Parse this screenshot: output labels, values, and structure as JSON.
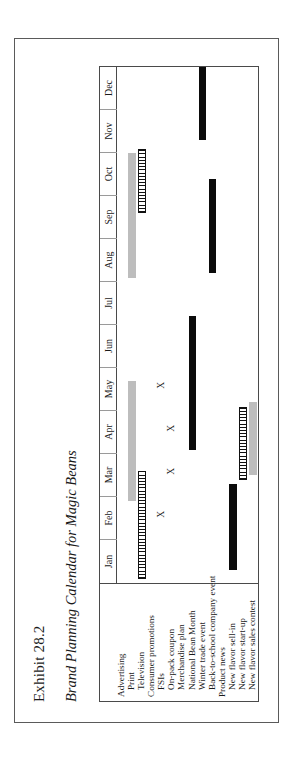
{
  "exhibit": {
    "number": "Exhibit 28.2",
    "title": "Brand Planning Calendar for Magic Beans"
  },
  "chart_data": {
    "type": "bar",
    "title": "Brand Planning Calendar for Magic Beans",
    "xlabel": "",
    "ylabel": "",
    "grid": false,
    "legend": null,
    "categories": [
      "Jan",
      "Feb",
      "Mar",
      "Apr",
      "May",
      "Jun",
      "Jul",
      "Aug",
      "Sep",
      "Oct",
      "Nov",
      "Dec"
    ],
    "xlim": [
      0,
      12
    ],
    "rows": [
      {
        "label": "Advertising",
        "group": true,
        "indent": false,
        "bars": [],
        "marks": []
      },
      {
        "label": "Print",
        "group": false,
        "indent": true,
        "bars": [
          {
            "style": "gray",
            "start": 1.9,
            "end": 4.7
          },
          {
            "style": "gray",
            "start": 7.1,
            "end": 10.0
          }
        ],
        "marks": []
      },
      {
        "label": "Television",
        "group": false,
        "indent": true,
        "bars": [
          {
            "style": "stripe",
            "start": 0.1,
            "end": 2.6
          },
          {
            "style": "stripe",
            "start": 8.6,
            "end": 10.1
          }
        ],
        "marks": []
      },
      {
        "label": "Consumer promotions",
        "group": true,
        "indent": false,
        "bars": [],
        "marks": []
      },
      {
        "label": "FSIs",
        "group": false,
        "indent": true,
        "bars": [],
        "marks": [
          1.6,
          4.6
        ]
      },
      {
        "label": "On-pack coupon",
        "group": false,
        "indent": true,
        "bars": [],
        "marks": [
          2.6,
          3.6
        ]
      },
      {
        "label": "Merchandise plan",
        "group": false,
        "indent": true,
        "bars": [],
        "marks": []
      },
      {
        "label": "National Bean Month",
        "group": false,
        "indent": true,
        "bars": [
          {
            "style": "solid",
            "start": 3.1,
            "end": 6.2
          }
        ],
        "marks": []
      },
      {
        "label": "Winter trade event",
        "group": false,
        "indent": true,
        "bars": [
          {
            "style": "solid",
            "start": 10.3,
            "end": 12.0
          }
        ],
        "marks": []
      },
      {
        "label": "Back-to-school company event",
        "group": false,
        "indent": true,
        "bars": [
          {
            "style": "solid",
            "start": 7.2,
            "end": 9.4
          }
        ],
        "marks": []
      },
      {
        "label": "Product news",
        "group": true,
        "indent": false,
        "bars": [],
        "marks": []
      },
      {
        "label": "New flavor sell-in",
        "group": false,
        "indent": true,
        "bars": [
          {
            "style": "solid",
            "start": 0.3,
            "end": 2.3
          }
        ],
        "marks": []
      },
      {
        "label": "New flavor start-up",
        "group": false,
        "indent": true,
        "bars": [
          {
            "style": "stripe",
            "start": 2.4,
            "end": 4.1
          }
        ],
        "marks": []
      },
      {
        "label": "New flavor sales contest",
        "group": false,
        "indent": true,
        "bars": [
          {
            "style": "gray",
            "start": 2.5,
            "end": 4.2
          }
        ],
        "marks": []
      }
    ],
    "colors": {
      "solid_bar": "#0b0b0b",
      "gray_bar": "#bdbdbd",
      "stripe_bar": "#111111",
      "frame": "#4a4a4a",
      "page_frame": "#5a5a5a"
    }
  }
}
